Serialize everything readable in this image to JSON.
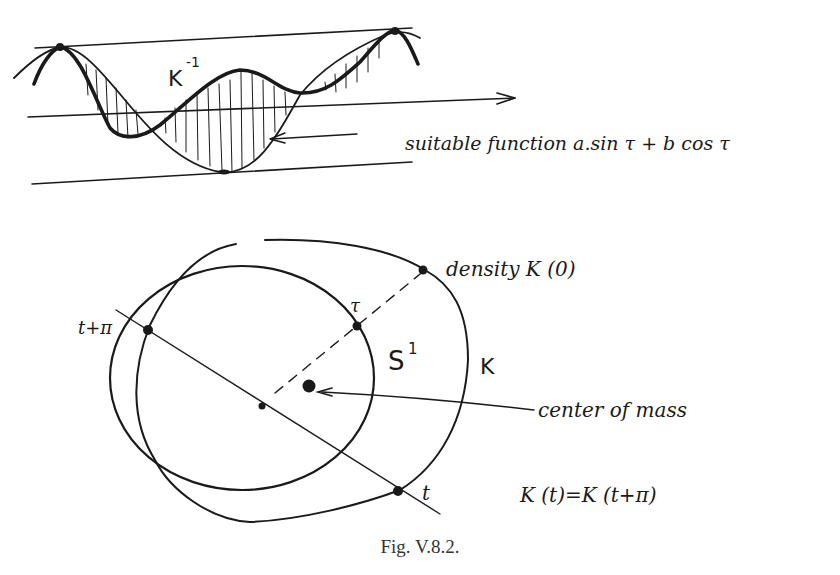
{
  "top_panel": {
    "curve_label": "K",
    "curve_label_exp": "-1",
    "annotation": "suitable function a.sin τ + b cos τ"
  },
  "bottom_panel": {
    "density_label": "density K (0)",
    "tau_label": "τ",
    "circle_label": "S",
    "circle_label_exp": "1",
    "outer_curve_label": "K",
    "t_plus_pi_label": "t+π",
    "t_label": "t",
    "center_label": "center of mass",
    "equation": "K (t)=K (t+π)"
  },
  "caption": "Fig. V.8.2.",
  "colors": {
    "ink": "#1a1a1a",
    "caption": "#333333",
    "background": "#ffffff"
  }
}
